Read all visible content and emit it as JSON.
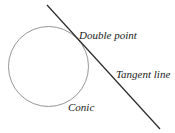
{
  "diagram": {
    "labels": {
      "double_point": "Double point",
      "tangent_line": "Tangent line",
      "conic": "Conic"
    },
    "colors": {
      "background": "#ffffff",
      "conic_stroke": "#8a8a8a",
      "line_stroke": "#2a2a2a",
      "text": "#1a1a1a"
    }
  }
}
